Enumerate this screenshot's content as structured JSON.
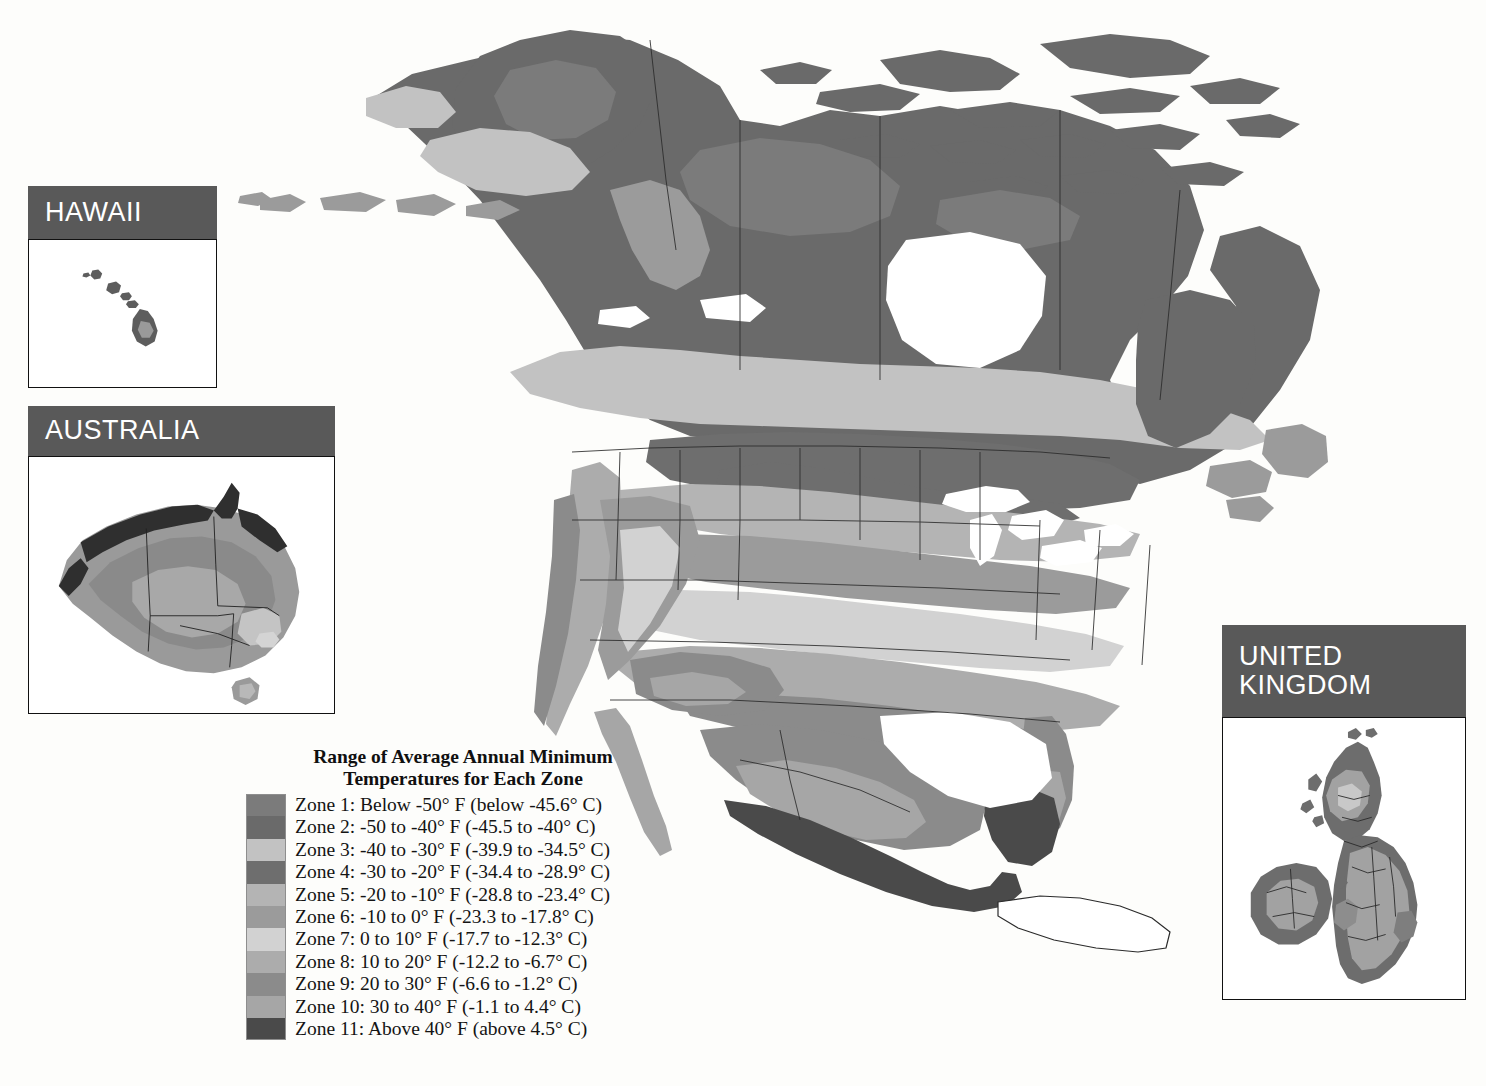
{
  "map": {
    "title": "Plant Hardiness Zone Map",
    "region": "North America",
    "background_color": "#fdfdfb",
    "border_color": "#2b2b2b"
  },
  "legend": {
    "title_line1": "Range of Average Annual Minimum",
    "title_line2": "Temperatures for Each Zone",
    "rows": [
      {
        "label": "Zone 1:  Below -50° F (below -45.6° C)",
        "color": "#7b7b7b"
      },
      {
        "label": "Zone 2:  -50 to -40° F (-45.5 to -40° C)",
        "color": "#6a6a6a"
      },
      {
        "label": "Zone 3:  -40 to -30° F (-39.9 to -34.5° C)",
        "color": "#c2c2c2"
      },
      {
        "label": "Zone 4:  -30 to -20° F (-34.4 to -28.9° C)",
        "color": "#6e6e6e"
      },
      {
        "label": "Zone 5:  -20 to -10° F (-28.8 to -23.4° C)",
        "color": "#b4b4b4"
      },
      {
        "label": "Zone 6:  -10 to 0° F (-23.3 to -17.8° C)",
        "color": "#9b9b9b"
      },
      {
        "label": "Zone 7:  0 to 10° F (-17.7 to -12.3° C)",
        "color": "#d2d2d2"
      },
      {
        "label": "Zone 8:  10 to 20° F (-12.2 to -6.7° C)",
        "color": "#acacac"
      },
      {
        "label": "Zone 9:  20 to 30° F (-6.6 to -1.2° C)",
        "color": "#8b8b8b"
      },
      {
        "label": "Zone 10:  30 to 40° F (-1.1 to 4.4° C)",
        "color": "#a6a6a6"
      },
      {
        "label": "Zone 11:  Above 40° F (above 4.5° C)",
        "color": "#4a4a4a"
      }
    ]
  },
  "insets": [
    {
      "id": "hawaii",
      "title": "HAWAII",
      "header_color": "#595959"
    },
    {
      "id": "australia",
      "title": "AUSTRALIA",
      "header_color": "#595959"
    },
    {
      "id": "uk",
      "title_line1": "UNITED",
      "title_line2": "KINGDOM",
      "header_color": "#595959"
    }
  ],
  "chart_data": {
    "type": "map",
    "title": "Range of Average Annual Minimum Temperatures for Each Zone",
    "zones": [
      {
        "zone": 1,
        "f_low": null,
        "f_high": -50,
        "c_low": null,
        "c_high": -45.6,
        "color": "#7b7b7b"
      },
      {
        "zone": 2,
        "f_low": -50,
        "f_high": -40,
        "c_low": -45.5,
        "c_high": -40,
        "color": "#6a6a6a"
      },
      {
        "zone": 3,
        "f_low": -40,
        "f_high": -30,
        "c_low": -39.9,
        "c_high": -34.5,
        "color": "#c2c2c2"
      },
      {
        "zone": 4,
        "f_low": -30,
        "f_high": -20,
        "c_low": -34.4,
        "c_high": -28.9,
        "color": "#6e6e6e"
      },
      {
        "zone": 5,
        "f_low": -20,
        "f_high": -10,
        "c_low": -28.8,
        "c_high": -23.4,
        "color": "#b4b4b4"
      },
      {
        "zone": 6,
        "f_low": -10,
        "f_high": 0,
        "c_low": -23.3,
        "c_high": -17.8,
        "color": "#9b9b9b"
      },
      {
        "zone": 7,
        "f_low": 0,
        "f_high": 10,
        "c_low": -17.7,
        "c_high": -12.3,
        "color": "#d2d2d2"
      },
      {
        "zone": 8,
        "f_low": 10,
        "f_high": 20,
        "c_low": -12.2,
        "c_high": -6.7,
        "color": "#acacac"
      },
      {
        "zone": 9,
        "f_low": 20,
        "f_high": 30,
        "c_low": -6.6,
        "c_high": -1.2,
        "color": "#8b8b8b"
      },
      {
        "zone": 10,
        "f_low": 30,
        "f_high": 40,
        "c_low": -1.1,
        "c_high": 4.4,
        "color": "#a6a6a6"
      },
      {
        "zone": 11,
        "f_low": 40,
        "f_high": null,
        "c_low": 4.5,
        "c_high": null,
        "color": "#4a4a4a"
      }
    ],
    "regions_shown": [
      "North America",
      "Hawaii",
      "Australia",
      "United Kingdom"
    ]
  }
}
